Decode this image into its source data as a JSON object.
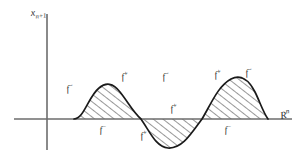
{
  "figure": {
    "type": "mathematical-plot",
    "background_color": "#ffffff",
    "curve_color": "#1a1a1a",
    "axis_color": "#6d6d6d",
    "hatch_color": "#1a1a1a",
    "axes": {
      "y_axis": {
        "label_base": "x",
        "label_sub": "n+1",
        "x_px": 47,
        "top_px": 14,
        "bottom_px": 150
      },
      "x_axis": {
        "label_base": "R",
        "label_sup": "n",
        "y_px": 119,
        "left_px": 14,
        "right_px": 292
      }
    },
    "curve": {
      "description": "oscillating curve with two positive humps and one negative trough, hatched between curve and axis",
      "start_x_px": 74,
      "end_x_px": 268,
      "zero_crossings_px": [
        74,
        141,
        202,
        268
      ],
      "hump1": {
        "start_px": 74,
        "end_px": 141,
        "peak_x_px": 107,
        "peak_y_px": 84
      },
      "trough": {
        "start_px": 141,
        "end_px": 202,
        "min_x_px": 171,
        "min_y_px": 148
      },
      "hump2": {
        "start_px": 202,
        "end_px": 268,
        "peak_x_px": 236,
        "peak_y_px": 78
      }
    },
    "labels": [
      {
        "id": "label-f-minus-hump1-left",
        "base": "f",
        "sup": "−",
        "x": 67,
        "y": 92,
        "region": "left flank of first hump"
      },
      {
        "id": "label-f-plus-hump1-right",
        "base": "f",
        "sup": "+",
        "x": 122,
        "y": 80,
        "region": "right flank of first hump"
      },
      {
        "id": "label-f-minus-below-hump1",
        "base": "f",
        "sup": "−",
        "x": 100,
        "y": 133,
        "region": "below axis under first hump"
      },
      {
        "id": "label-f-minus-trough-top",
        "base": "f",
        "sup": "−",
        "x": 163,
        "y": 80,
        "region": "above middle trough"
      },
      {
        "id": "label-f-plus-trough-in",
        "base": "f",
        "sup": "+",
        "x": 171,
        "y": 112,
        "region": "inside middle region above axis"
      },
      {
        "id": "label-f-plus-trough-left",
        "base": "f",
        "sup": "+",
        "x": 141,
        "y": 139,
        "region": "lower left of trough"
      },
      {
        "id": "label-f-plus-hump2-left",
        "base": "f",
        "sup": "+",
        "x": 215,
        "y": 78,
        "region": "left flank of second hump"
      },
      {
        "id": "label-f-minus-hump2-right",
        "base": "f",
        "sup": "−",
        "x": 246,
        "y": 76,
        "region": "right flank of second hump"
      },
      {
        "id": "label-f-minus-below-hump2",
        "base": "f",
        "sup": "−",
        "x": 225,
        "y": 133,
        "region": "below axis under second hump"
      }
    ]
  }
}
